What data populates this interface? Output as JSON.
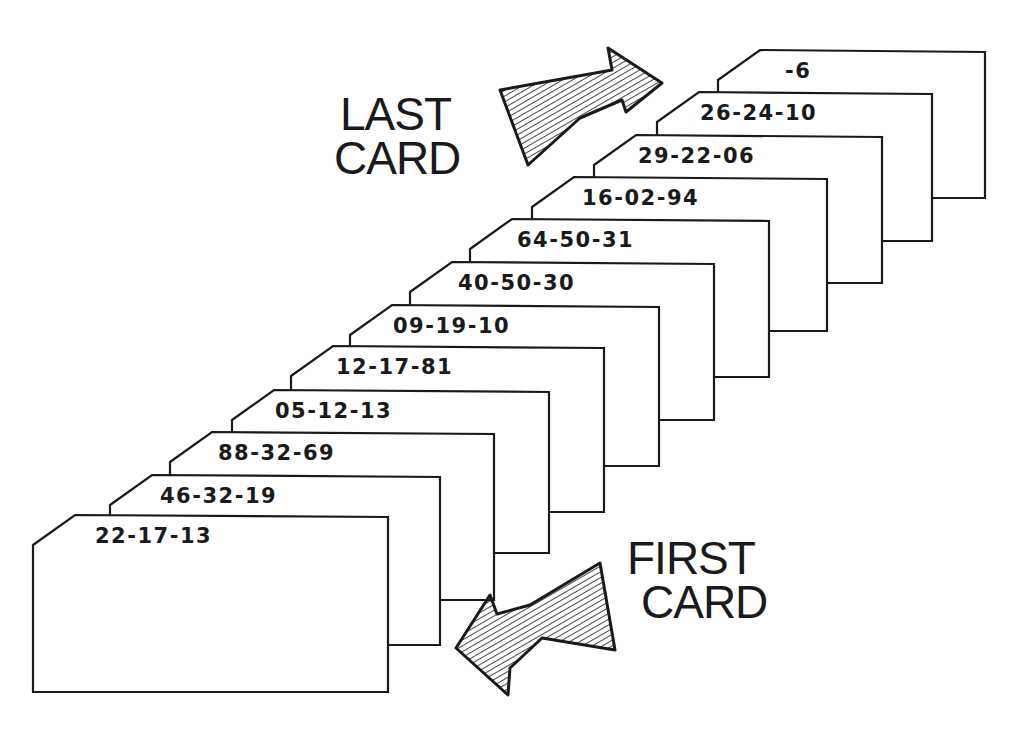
{
  "diagram": {
    "labels": {
      "last_card": [
        "LAST",
        "CARD"
      ],
      "first_card": [
        "FIRST",
        "CARD"
      ]
    },
    "arrows": [
      {
        "name": "last-card-arrow",
        "direction": "up-right"
      },
      {
        "name": "first-card-arrow",
        "direction": "down-left"
      }
    ],
    "cards_front_to_back": [
      "22-17-13",
      "46-32-19",
      "88-32-69",
      "05-12-13",
      "12-17-81",
      "09-19-10",
      "40-50-30",
      "64-50-31",
      "16-02-94",
      "29-22-06",
      "26-24-10",
      "-6"
    ],
    "colors": {
      "ink": "#1a1a1a",
      "paper": "#ffffff"
    }
  }
}
